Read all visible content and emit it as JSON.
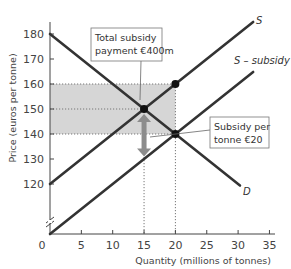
{
  "chart_data": {
    "type": "line",
    "title": "",
    "xlabel": "Quantity (millions of tonnes)",
    "ylabel": "Price (euros per tonne)",
    "xlim": [
      0,
      35
    ],
    "ylim": [
      100,
      185
    ],
    "y_axis_break": true,
    "grid": false,
    "x_ticks": [
      0,
      5,
      10,
      15,
      20,
      25,
      30,
      35
    ],
    "y_ticks": [
      120,
      130,
      140,
      150,
      160,
      170,
      180
    ],
    "series": [
      {
        "name": "D",
        "label": "D",
        "points": [
          [
            0,
            180
          ],
          [
            30.3,
            119.4
          ]
        ],
        "equation": "P = 180 - 2Q"
      },
      {
        "name": "S",
        "label": "S",
        "points": [
          [
            0,
            120
          ],
          [
            32.4,
            184.8
          ]
        ],
        "equation": "P = 120 + 2Q"
      },
      {
        "name": "S - subsidy",
        "label": "S – subsidy",
        "points": [
          [
            0,
            100
          ],
          [
            32.4,
            164.8
          ]
        ],
        "equation": "P = 100 + 2Q"
      }
    ],
    "markers": [
      {
        "name": "original-equilibrium",
        "x": 15,
        "y": 150
      },
      {
        "name": "supply-price-with-subsidy",
        "x": 20,
        "y": 160
      },
      {
        "name": "new-equilibrium",
        "x": 20,
        "y": 140
      }
    ],
    "shaded_region": {
      "x": [
        0,
        20
      ],
      "y": [
        140,
        160
      ],
      "meaning": "Total subsidy payment €400m"
    },
    "guides": {
      "horizontal": [
        160,
        150,
        140
      ],
      "vertical": [
        15,
        20
      ]
    },
    "arrow": {
      "x": 15,
      "from": 148,
      "to": 131,
      "style": "double-headed"
    },
    "annotations": [
      {
        "text_lines": [
          "Total subsidy",
          "payment €400m"
        ],
        "points_to": [
          14,
          156
        ]
      },
      {
        "text_lines": [
          "Subsidy per",
          "tonne €20"
        ],
        "points_to": [
          15.5,
          139.5
        ]
      }
    ]
  },
  "colors": {
    "line": "#333333",
    "shade": "#d6d6d6",
    "arrow": "#8c8c8c",
    "axis": "#444444",
    "guide": "#777777"
  }
}
